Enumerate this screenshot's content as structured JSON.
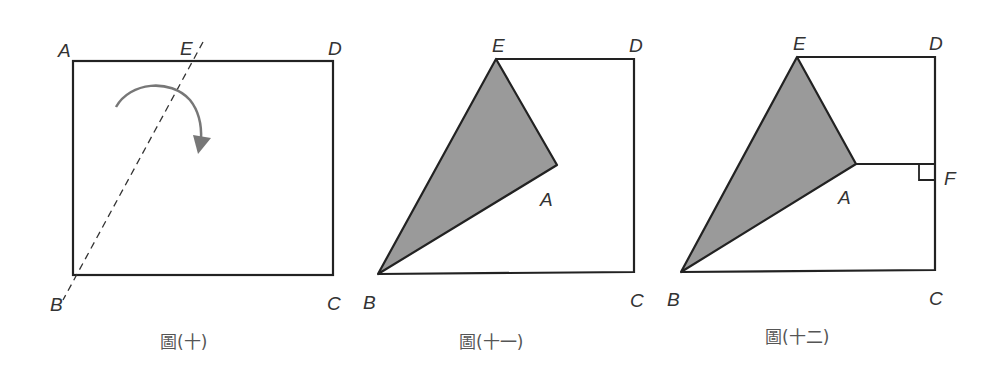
{
  "figures": [
    {
      "caption": "圖(十)",
      "labels": {
        "A": "A",
        "B": "B",
        "C": "C",
        "D": "D",
        "E": "E"
      },
      "description": "Rectangle ABCD with dashed fold line BE and curved fold arrow"
    },
    {
      "caption": "圖(十一)",
      "labels": {
        "A": "A",
        "B": "B",
        "C": "C",
        "D": "D",
        "E": "E"
      },
      "description": "Triangle ABE folded over along BE, shaded gray"
    },
    {
      "caption": "圖(十二)",
      "labels": {
        "A": "A",
        "B": "B",
        "C": "C",
        "D": "D",
        "E": "E",
        "F": "F"
      },
      "description": "Folded figure with segment AF perpendicular to CD at F"
    }
  ],
  "colors": {
    "stroke": "#222222",
    "shade": "#9a9a9a",
    "arrow": "#777777",
    "dash": "#333333"
  }
}
